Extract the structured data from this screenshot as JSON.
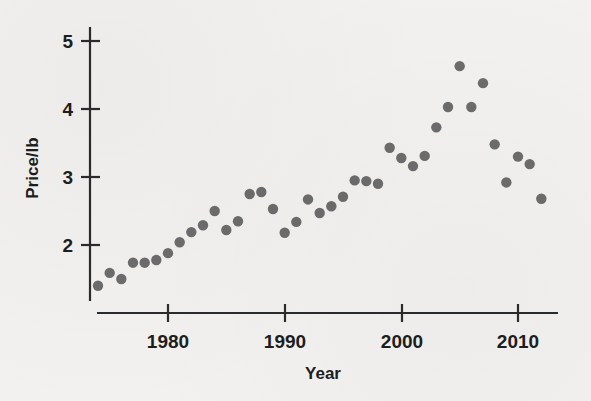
{
  "figure": {
    "background_color": "#f2f1ef",
    "point_color": "#6c6c6c",
    "axis_color": "#2b2b2b",
    "x_axis_title": "Year",
    "y_axis_title": "Price/lb"
  },
  "chart_data": {
    "type": "scatter",
    "title": "",
    "subtitle": "",
    "xlabel": "Year",
    "ylabel": "Price/lb",
    "xlim": [
      1973,
      2013.5
    ],
    "ylim": [
      1.2,
      5.25
    ],
    "xticks": [
      1980,
      1990,
      2000,
      2010
    ],
    "xtick_labels": [
      "1980",
      "1990",
      "2000",
      "2010"
    ],
    "yticks": [
      2,
      3,
      4,
      5
    ],
    "ytick_labels": [
      "2",
      "3",
      "4",
      "5"
    ],
    "grid": false,
    "legend": null,
    "legend_position": "none",
    "annotations": [],
    "series": [
      {
        "name": "Price per pound",
        "marker": "circle",
        "color": "#6c6c6c",
        "x": [
          1974,
          1975,
          1976,
          1977,
          1978,
          1979,
          1980,
          1981,
          1982,
          1983,
          1984,
          1985,
          1986,
          1987,
          1988,
          1989,
          1990,
          1991,
          1992,
          1993,
          1994,
          1995,
          1996,
          1997,
          1998,
          1999,
          2000,
          2001,
          2002,
          2003,
          2004,
          2005,
          2006,
          2007,
          2008,
          2009,
          2010,
          2011,
          2012
        ],
        "y": [
          1.4,
          1.59,
          1.5,
          1.74,
          1.74,
          1.78,
          1.88,
          2.04,
          2.19,
          2.29,
          2.5,
          2.22,
          2.35,
          2.75,
          2.78,
          2.53,
          2.18,
          2.34,
          2.67,
          2.47,
          2.57,
          2.71,
          2.95,
          2.94,
          2.9,
          3.43,
          3.28,
          3.16,
          3.31,
          3.73,
          4.03,
          4.63,
          4.03,
          4.38,
          3.48,
          2.92,
          3.3,
          3.19,
          2.68
        ]
      }
    ]
  }
}
